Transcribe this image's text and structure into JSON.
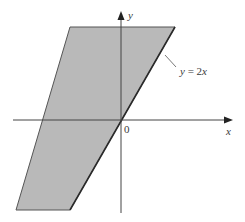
{
  "diagram": {
    "type": "region-plot",
    "colors": {
      "region_fill": "#b9b9b9",
      "region_edge": "#555555",
      "boundary_line": "#2a2a2a",
      "axis": "#444444",
      "text": "#3a3a3a",
      "background": "#ffffff"
    },
    "axes": {
      "x_label": "x",
      "y_label": "y",
      "origin_label": "0"
    },
    "boundary": {
      "label": "y = 2x",
      "equation_lhs": "y",
      "equation_eq": " = 2",
      "equation_var": "x"
    },
    "region": {
      "shape": "parallelogram",
      "shaded": true
    }
  }
}
